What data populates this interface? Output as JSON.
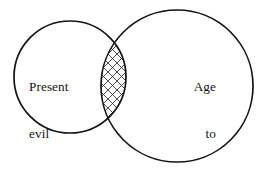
{
  "diagram": {
    "type": "venn-two-set",
    "background_color": "#ffffff",
    "stroke_color": "#141414",
    "hatch_color": "#3a3a3a",
    "sets": [
      {
        "id": "present-evil-age",
        "label_lines": [
          "Present",
          "evil",
          "age"
        ],
        "label_align": "left",
        "cx": 70,
        "cy": 77,
        "r": 56
      },
      {
        "id": "age-to-come",
        "label_lines": [
          "Age",
          "to",
          "come"
        ],
        "label_align": "right",
        "cx": 177,
        "cy": 86,
        "r": 76
      }
    ],
    "intersection": {
      "id": "overlap-region",
      "fill": "cross-hatch",
      "description": "hatched lens where the present evil age and the age to come overlap"
    }
  }
}
